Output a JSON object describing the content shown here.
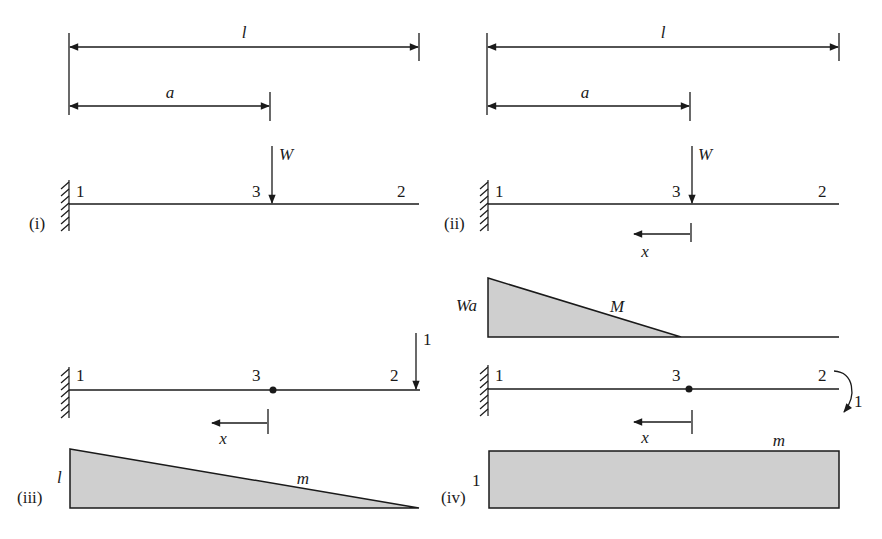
{
  "figure": {
    "panels": [
      {
        "id": "i",
        "label": "(i)",
        "dims": {
          "total": "l",
          "partial": "a"
        },
        "nodes": [
          "1",
          "3",
          "2"
        ],
        "load": "W"
      },
      {
        "id": "ii",
        "label": "(ii)",
        "dims": {
          "total": "l",
          "partial": "a"
        },
        "nodes": [
          "1",
          "3",
          "2"
        ],
        "load": "W",
        "coord": "x",
        "moment_label": "M",
        "moment_value": "Wa"
      },
      {
        "id": "iii",
        "label": "(iii)",
        "nodes": [
          "1",
          "3",
          "2"
        ],
        "unit_load": "1",
        "coord": "x",
        "moment_label": "m",
        "moment_value": "l"
      },
      {
        "id": "iv",
        "label": "(iv)",
        "nodes": [
          "1",
          "3",
          "2"
        ],
        "unit_moment": "1",
        "coord": "x",
        "moment_label": "m",
        "moment_value": "1"
      }
    ],
    "colors": {
      "ink": "#1a1a1a",
      "fill": "#cfcfcf",
      "background": "#ffffff"
    }
  }
}
